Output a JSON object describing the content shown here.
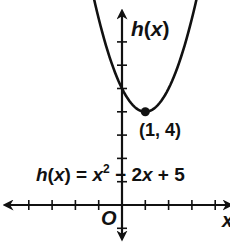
{
  "chart_data": {
    "type": "line",
    "title": "",
    "function": "h(x) = x^2 - 2x + 5",
    "xlabel": "x",
    "ylabel": "h(x)",
    "origin_label": "O",
    "xlim": [
      -4,
      4
    ],
    "ylim": [
      -1,
      7
    ],
    "grid": false,
    "ticks_x": [
      -4,
      -3,
      -2,
      -1,
      1,
      2,
      3,
      4
    ],
    "ticks_y": [
      -1,
      1,
      2,
      3,
      4,
      5,
      6,
      7
    ],
    "points": [
      {
        "x": -1.3,
        "y": 8.29
      },
      {
        "x": -1,
        "y": 8
      },
      {
        "x": -0.5,
        "y": 6.25
      },
      {
        "x": 0,
        "y": 5
      },
      {
        "x": 0.5,
        "y": 4.25
      },
      {
        "x": 1,
        "y": 4
      },
      {
        "x": 1.5,
        "y": 4.25
      },
      {
        "x": 2,
        "y": 5
      },
      {
        "x": 2.5,
        "y": 6.25
      },
      {
        "x": 3,
        "y": 8
      },
      {
        "x": 3.3,
        "y": 8.29
      }
    ],
    "annotations": [
      {
        "text": "(1, 4)",
        "x": 1,
        "y": 4,
        "marker": "dot"
      }
    ],
    "equation_label": {
      "h": "h",
      "paren_open": "(",
      "x": "x",
      "rest1": ") = ",
      "x2": "x",
      "sup": "2",
      "rest2": " − 2",
      "x3": "x",
      "rest3": " + 5"
    }
  },
  "labels": {
    "y_axis": {
      "h": "h",
      "open": "(",
      "x": "x",
      "close": ")"
    },
    "x_axis": "x",
    "origin": "O",
    "vertex": "(1, 4)"
  }
}
